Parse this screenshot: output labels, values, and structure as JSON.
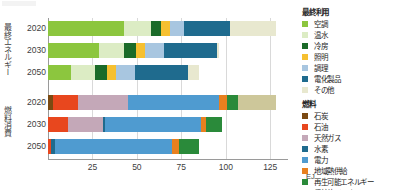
{
  "units": {
    "label": "EJ"
  },
  "axis": {
    "ticks": [
      "0",
      "25",
      "50",
      "75",
      "100",
      "125"
    ],
    "tick_values": [
      0,
      25,
      50,
      75,
      100,
      125
    ],
    "xmin": 0,
    "xmax": 135
  },
  "groups": {
    "enduse": {
      "axis_label": "最終エネルギー消費",
      "categories": [
        "2020",
        "2030",
        "2050"
      ]
    },
    "fuel": {
      "axis_label": "燃料消費",
      "categories": [
        "2020",
        "2030",
        "2050"
      ]
    }
  },
  "legends": [
    {
      "title": "最終利用",
      "items": [
        {
          "label": "空調",
          "color": "#8cc63e"
        },
        {
          "label": "温水",
          "color": "#dcecc4"
        },
        {
          "label": "冷房",
          "color": "#1b6b29"
        },
        {
          "label": "照明",
          "color": "#f6c030"
        },
        {
          "label": "調理",
          "color": "#a8c6e0"
        },
        {
          "label": "電化製品",
          "color": "#1f6b8e"
        },
        {
          "label": "その他",
          "color": "#e8e8cf"
        }
      ]
    },
    {
      "title": "燃料",
      "items": [
        {
          "label": "石炭",
          "color": "#7b4a12"
        },
        {
          "label": "石油",
          "color": "#e8471e"
        },
        {
          "label": "天然ガス",
          "color": "#c4a8b8"
        },
        {
          "label": "水素",
          "color": "#1f6b8e"
        },
        {
          "label": "電力",
          "color": "#4f9bd0"
        },
        {
          "label": "地域熱供給",
          "color": "#e8801f"
        },
        {
          "label": "再生可能エネルギー",
          "color": "#2a8a3a"
        },
        {
          "label": "伝統的バイオマス",
          "color": "#cdc79a"
        }
      ]
    }
  ],
  "chart_data": [
    {
      "type": "bar",
      "orientation": "horizontal",
      "stacked": true,
      "title": "最終利用",
      "xlabel": "EJ",
      "ylabel": "最終エネルギー消費",
      "xlim": [
        0,
        135
      ],
      "grid": true,
      "legend_position": "right",
      "categories": [
        "2020",
        "2030",
        "2050"
      ],
      "series": [
        {
          "name": "空調",
          "color": "#8cc63e",
          "values": [
            43.0,
            28.5,
            13.0
          ]
        },
        {
          "name": "温水",
          "color": "#dcecc4",
          "values": [
            15.0,
            14.5,
            13.5
          ]
        },
        {
          "name": "冷房",
          "color": "#1b6b29",
          "values": [
            5.5,
            6.5,
            6.5
          ]
        },
        {
          "name": "照明",
          "color": "#f6c030",
          "values": [
            5.0,
            5.0,
            5.5
          ]
        },
        {
          "name": "調理",
          "color": "#a8c6e0",
          "values": [
            8.0,
            11.0,
            10.5
          ]
        },
        {
          "name": "電化製品",
          "color": "#1f6b8e",
          "values": [
            26.0,
            29.5,
            30.0
          ]
        },
        {
          "name": "その他",
          "color": "#e8e8cf",
          "values": [
            25.5,
            1.0,
            6.0
          ]
        }
      ],
      "totals": [
        128.0,
        96.0,
        85.0
      ]
    },
    {
      "type": "bar",
      "orientation": "horizontal",
      "stacked": true,
      "title": "燃料",
      "xlabel": "EJ",
      "ylabel": "燃料消費",
      "xlim": [
        0,
        135
      ],
      "grid": true,
      "legend_position": "right",
      "categories": [
        "2020",
        "2030",
        "2050"
      ],
      "series": [
        {
          "name": "石炭",
          "color": "#7b4a12",
          "values": [
            3.0,
            0.0,
            0.0
          ]
        },
        {
          "name": "石油",
          "color": "#e8471e",
          "values": [
            14.0,
            11.0,
            1.5
          ]
        },
        {
          "name": "天然ガス",
          "color": "#c4a8b8",
          "values": [
            28.0,
            20.0,
            0.0
          ]
        },
        {
          "name": "水素",
          "color": "#1f6b8e",
          "values": [
            0.0,
            1.0,
            2.5
          ]
        },
        {
          "name": "電力",
          "color": "#4f9bd0",
          "values": [
            51.0,
            54.0,
            66.0
          ]
        },
        {
          "name": "地域熱供給",
          "color": "#e8801f",
          "values": [
            4.5,
            3.0,
            3.5
          ]
        },
        {
          "name": "再生可能エネルギー",
          "color": "#2a8a3a",
          "values": [
            6.5,
            9.0,
            11.5
          ]
        },
        {
          "name": "伝統的バイオマス",
          "color": "#cdc79a",
          "values": [
            21.0,
            0.0,
            0.0
          ]
        }
      ],
      "totals": [
        128.0,
        98.0,
        85.0
      ]
    }
  ]
}
